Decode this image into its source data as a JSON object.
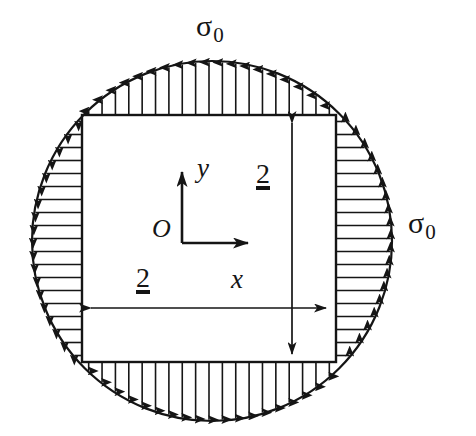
{
  "figure": {
    "title_alt": "Square plate inscribed in a circular region under biaxial uniform tension sigma-0",
    "background_color": "#ffffff",
    "stroke_color": "#151515"
  },
  "labels": {
    "sigma_top": {
      "symbol": "σ",
      "subscript": "0",
      "name": "sigma-zero"
    },
    "sigma_right": {
      "symbol": "σ",
      "subscript": "0",
      "name": "sigma-zero"
    },
    "axis_y": "y",
    "axis_x": "x",
    "origin": "O",
    "dim_vertical": "2",
    "dim_horizontal": "2"
  },
  "geometry": {
    "circle": {
      "cx": 212,
      "cy": 241,
      "r": 180
    },
    "square": {
      "x": 82,
      "y": 115,
      "width": 254,
      "height": 247
    },
    "origin_point": {
      "x": 182,
      "y": 243
    },
    "axis_y_arrow": {
      "x1": 182,
      "y1": 243,
      "x2": 182,
      "y2": 166
    },
    "axis_x_arrow": {
      "x1": 182,
      "y1": 243,
      "x2": 253,
      "y2": 243
    },
    "dim_vertical_line": {
      "x": 292,
      "y1": 117,
      "y2": 360
    },
    "dim_horizontal_line": {
      "y": 308,
      "x1": 85,
      "x2": 332
    }
  },
  "load_arrows": {
    "top": {
      "count": 19,
      "direction": "up",
      "description": "traction arrows on top edge pointing outward"
    },
    "bottom": {
      "count": 19,
      "direction": "down",
      "description": "traction arrows on bottom edge pointing outward"
    },
    "left": {
      "count": 19,
      "direction": "left",
      "description": "traction arrows on left edge pointing outward"
    },
    "right": {
      "count": 19,
      "direction": "right",
      "description": "traction arrows on right edge pointing outward"
    }
  }
}
